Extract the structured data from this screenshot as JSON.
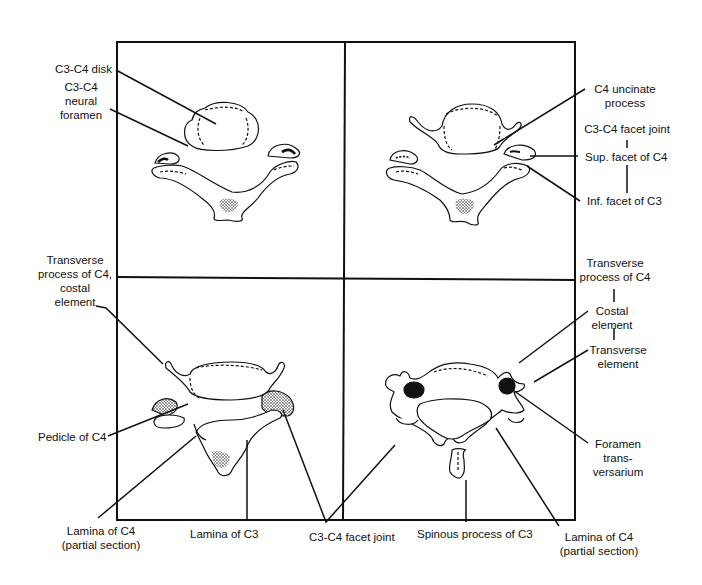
{
  "figure": {
    "colors": {
      "ink": "#111111",
      "background": "#ffffff",
      "stipple": "#333333"
    },
    "panels": [
      {
        "id": "top-left",
        "name": "C3-C4 disk level section"
      },
      {
        "id": "top-right",
        "name": "C4 uncinate / facet joint level section"
      },
      {
        "id": "bottom-left",
        "name": "Pedicle of C4 level section"
      },
      {
        "id": "bottom-right",
        "name": "Foramen transversarium level section"
      }
    ]
  },
  "labels": {
    "c3c4_disk": "C3-C4 disk",
    "c3c4_neural_foramen": "C3-C4\nneural\nforamen",
    "c4_uncinate_process": "C4 uncinate\nprocess",
    "c3c4_facet_joint_top": "C3-C4 facet joint",
    "sup_facet_c4": "Sup. facet of C4",
    "inf_facet_c3": "Inf. facet of C3",
    "transverse_process_costal_left": "Transverse\nprocess of C4,\ncostal\nelement",
    "transverse_process_c4_right": "Transverse\nprocess of C4",
    "costal_element": "Costal\nelement",
    "transverse_element": "Transverse\nelement",
    "pedicle_c4": "Pedicle of C4",
    "foramen_transversarium": "Foramen\ntrans-\nversarium",
    "lamina_c4_left": "Lamina of C4\n(partial section)",
    "lamina_c3": "Lamina of C3",
    "c3c4_facet_joint_bottom": "C3-C4 facet joint",
    "spinous_process_c3": "Spinous process of C3",
    "lamina_c4_right": "Lamina of C4\n(partial section)"
  }
}
